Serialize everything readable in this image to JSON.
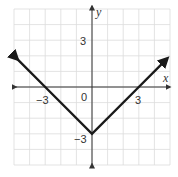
{
  "chart_data": {
    "type": "line",
    "title": "",
    "function": "y = |x| - 3",
    "xlabel": "x",
    "ylabel": "y",
    "xlim": [
      -5,
      5
    ],
    "ylim": [
      -5,
      5
    ],
    "grid": true,
    "tick_labels": {
      "x": [
        {
          "value": -3,
          "label": "−3"
        },
        {
          "value": 3,
          "label": "3"
        }
      ],
      "y": [
        {
          "value": 3,
          "label": "3"
        },
        {
          "value": -3,
          "label": "−3"
        }
      ],
      "origin": "0"
    },
    "series": [
      {
        "name": "y = |x| - 3",
        "points": [
          [
            -4.8,
            1.8
          ],
          [
            -3,
            0
          ],
          [
            0,
            -3
          ],
          [
            3,
            0
          ],
          [
            4.8,
            1.8
          ]
        ],
        "arrows": "both-ends",
        "color": "#1a1a1a"
      }
    ]
  },
  "labels": {
    "x_axis": "x",
    "y_axis": "y",
    "origin": "0",
    "x_neg3": "−3",
    "x_pos3": "3",
    "y_pos3": "3",
    "y_neg3": "−3"
  },
  "colors": {
    "grid": "#dcdcdc",
    "axis": "#333333",
    "curve": "#1a1a1a"
  }
}
